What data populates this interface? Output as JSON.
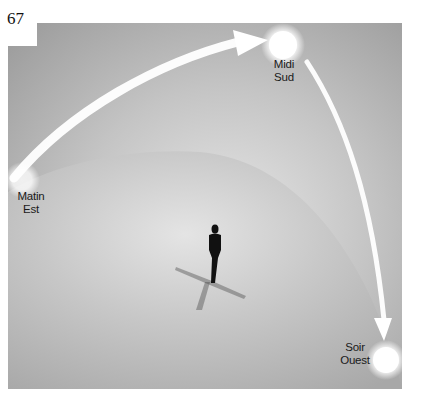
{
  "page_number": "67",
  "sun_positions": [
    {
      "id": "morning",
      "time_label": "Matin",
      "direction_label": "Est"
    },
    {
      "id": "noon",
      "time_label": "Midi",
      "direction_label": "Sud"
    },
    {
      "id": "evening",
      "time_label": "Soir",
      "direction_label": "Ouest"
    }
  ],
  "colors": {
    "sky_dark": "#9a9a9a",
    "sky_light": "#d8d8d8",
    "ground": "#b4b4b4",
    "sun": "#ffffff",
    "arrow": "#ffffff",
    "figure": "#111111"
  }
}
